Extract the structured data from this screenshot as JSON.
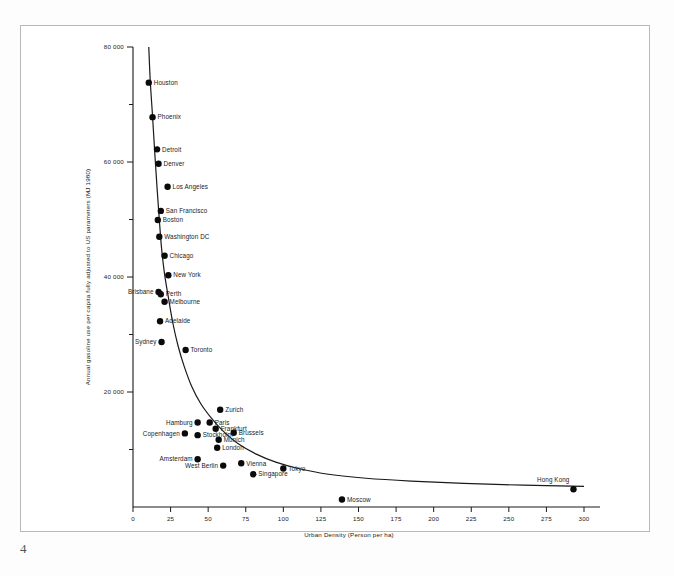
{
  "page": {
    "number": "4"
  },
  "chart_data": {
    "type": "scatter",
    "title": "",
    "xlabel": "Urban Density (Person per ha)",
    "ylabel": "Annual gasoline use per capita fully adjusted to US parameters (MJ 1980)",
    "xlim": [
      0,
      300
    ],
    "ylim": [
      0,
      80000
    ],
    "xticks": [
      0,
      25,
      50,
      75,
      100,
      125,
      150,
      175,
      200,
      225,
      250,
      275,
      300
    ],
    "xticklabels": [
      "0",
      "25",
      "50",
      "75",
      "100",
      "125",
      "150",
      "175",
      "200",
      "225",
      "250",
      "275",
      "300"
    ],
    "yticks": [
      0,
      20000,
      40000,
      60000,
      80000
    ],
    "yticklabels": [
      "",
      "20 000",
      "40 000",
      "60 000",
      "80 000"
    ],
    "grid": false,
    "legend": false,
    "legend_position": "none",
    "fit_curve": {
      "description": "hyperbolic best-fit curve through city points",
      "points": [
        [
          10.5,
          80000
        ],
        [
          11.5,
          74000
        ],
        [
          13.0,
          68000
        ],
        [
          14.5,
          61500
        ],
        [
          16.0,
          55500
        ],
        [
          17.5,
          50000
        ],
        [
          19.0,
          45000
        ],
        [
          21.0,
          40500
        ],
        [
          23.5,
          36500
        ],
        [
          26.5,
          32000
        ],
        [
          30.0,
          28000
        ],
        [
          34.0,
          24500
        ],
        [
          39.0,
          21000
        ],
        [
          45.0,
          18000
        ],
        [
          52.0,
          15500
        ],
        [
          60.0,
          13200
        ],
        [
          70.0,
          11000
        ],
        [
          82.0,
          9200
        ],
        [
          95.0,
          7800
        ],
        [
          110.0,
          6700
        ],
        [
          130.0,
          5700
        ],
        [
          155.0,
          5000
        ],
        [
          185.0,
          4500
        ],
        [
          220.0,
          4100
        ],
        [
          260.0,
          3800
        ],
        [
          300.0,
          3600
        ]
      ]
    },
    "points": [
      {
        "city": "Houston",
        "x": 10.5,
        "y": 73800,
        "label_side": "right"
      },
      {
        "city": "Phoenix",
        "x": 13.0,
        "y": 67800,
        "label_side": "right"
      },
      {
        "city": "Detroit",
        "x": 16.0,
        "y": 62200,
        "label_side": "right"
      },
      {
        "city": "Denver",
        "x": 17.0,
        "y": 59700,
        "label_side": "right"
      },
      {
        "city": "Los Angeles",
        "x": 23.0,
        "y": 55700,
        "label_side": "right"
      },
      {
        "city": "San Francisco",
        "x": 18.5,
        "y": 51500,
        "label_side": "right"
      },
      {
        "city": "Boston",
        "x": 16.5,
        "y": 49900,
        "label_side": "right"
      },
      {
        "city": "Washington DC",
        "x": 17.5,
        "y": 47000,
        "label_side": "right"
      },
      {
        "city": "Chicago",
        "x": 21.0,
        "y": 43700,
        "label_side": "right"
      },
      {
        "city": "New York",
        "x": 23.5,
        "y": 40300,
        "label_side": "right"
      },
      {
        "city": "Brisbane",
        "x": 17.0,
        "y": 37400,
        "label_side": "left"
      },
      {
        "city": "Perth",
        "x": 18.5,
        "y": 37000,
        "label_side": "right"
      },
      {
        "city": "Melbourne",
        "x": 21.0,
        "y": 35700,
        "label_side": "right"
      },
      {
        "city": "Adelaide",
        "x": 18.0,
        "y": 32300,
        "label_side": "right"
      },
      {
        "city": "Sydney",
        "x": 19.0,
        "y": 28700,
        "label_side": "left"
      },
      {
        "city": "Toronto",
        "x": 35.0,
        "y": 27300,
        "label_side": "right"
      },
      {
        "city": "Zurich",
        "x": 58.0,
        "y": 16900,
        "label_side": "right"
      },
      {
        "city": "Hamburg",
        "x": 43.0,
        "y": 14700,
        "label_side": "left"
      },
      {
        "city": "Paris",
        "x": 51.0,
        "y": 14700,
        "label_side": "right"
      },
      {
        "city": "Frankfurt",
        "x": 55.0,
        "y": 13600,
        "label_side": "right"
      },
      {
        "city": "Brussels",
        "x": 67.0,
        "y": 12900,
        "label_side": "right"
      },
      {
        "city": "Copenhagen",
        "x": 34.5,
        "y": 12800,
        "label_side": "left"
      },
      {
        "city": "Stockholm",
        "x": 43.0,
        "y": 12500,
        "label_side": "right"
      },
      {
        "city": "Munich",
        "x": 57.0,
        "y": 11700,
        "label_side": "right"
      },
      {
        "city": "London",
        "x": 56.0,
        "y": 10300,
        "label_side": "right"
      },
      {
        "city": "Amsterdam",
        "x": 43.0,
        "y": 8300,
        "label_side": "left"
      },
      {
        "city": "West Berlin",
        "x": 60.0,
        "y": 7200,
        "label_side": "left"
      },
      {
        "city": "Vienna",
        "x": 72.0,
        "y": 7600,
        "label_side": "right"
      },
      {
        "city": "Singapore",
        "x": 80.0,
        "y": 5700,
        "label_side": "right"
      },
      {
        "city": "Tokyo",
        "x": 100.0,
        "y": 6700,
        "label_side": "right"
      },
      {
        "city": "Moscow",
        "x": 139.0,
        "y": 1300,
        "label_side": "right"
      },
      {
        "city": "Hong Kong",
        "x": 293.0,
        "y": 3100,
        "label_side": "above-left"
      }
    ]
  }
}
